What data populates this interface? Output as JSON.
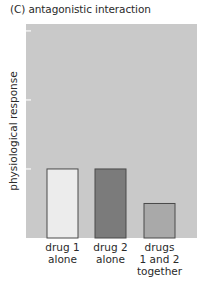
{
  "chart_data": {
    "type": "bar",
    "title": "(C) antagonistic interaction",
    "xlabel": "",
    "ylabel": "physiological response",
    "categories": [
      "drug 1\nalone",
      "drug 2\nalone",
      "drugs\n1 and 2\ntogether"
    ],
    "category_lines": [
      [
        "drug 1",
        "alone"
      ],
      [
        "drug 2",
        "alone"
      ],
      [
        "drugs",
        "1 and 2",
        "together"
      ]
    ],
    "values": [
      1.0,
      1.0,
      0.5
    ],
    "ylim": [
      0,
      3.1
    ],
    "yticks": [
      1,
      2,
      3
    ],
    "ytick_labels": [
      "",
      "",
      ""
    ],
    "grid": false,
    "legend": null,
    "colors": {
      "plot_background": "#c9c9c9",
      "bars": [
        "#ececec",
        "#7b7b7b",
        "#a9a9a9"
      ],
      "bar_outline": "#4a4a4a",
      "tick": "#f2f2f2"
    }
  }
}
